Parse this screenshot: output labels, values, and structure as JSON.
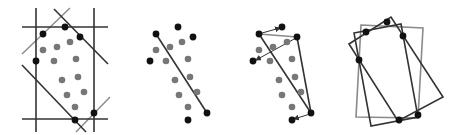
{
  "figure": {
    "colors": {
      "hull_point": "#111111",
      "interior_point": "#777777",
      "line_dark": "#333333",
      "line_gray": "#8a8a8a",
      "background": "#ffffff"
    },
    "panels": [
      {
        "id": "panel-1",
        "caption": "",
        "hull_points": [
          [
            43,
            34
          ],
          [
            65,
            27
          ],
          [
            80,
            37
          ],
          [
            36,
            61
          ],
          [
            94,
            113
          ],
          [
            75,
            120
          ]
        ],
        "interior_points": [
          [
            43,
            50
          ],
          [
            57,
            47
          ],
          [
            70,
            42
          ],
          [
            54,
            61
          ],
          [
            76,
            59
          ],
          [
            62,
            80
          ],
          [
            78,
            77
          ],
          [
            67,
            95
          ],
          [
            84,
            92
          ],
          [
            75,
            107
          ]
        ],
        "dark_lines": [
          [
            36,
            8,
            36,
            132
          ],
          [
            94,
            8,
            94,
            132
          ],
          [
            22,
            27,
            108,
            27
          ],
          [
            22,
            119,
            108,
            119
          ],
          [
            54,
            9,
            108,
            64
          ],
          [
            22,
            65,
            86,
            132
          ]
        ],
        "gray_lines": [
          [
            22,
            54,
            70,
            8
          ],
          [
            76,
            132,
            110,
            97
          ]
        ]
      },
      {
        "id": "panel-2",
        "caption": "",
        "hull_points": [
          [
            156,
            34
          ],
          [
            178,
            27
          ],
          [
            193,
            37
          ],
          [
            150,
            61
          ],
          [
            207,
            113
          ],
          [
            188,
            120
          ]
        ],
        "interior_points": [
          [
            156,
            50
          ],
          [
            170,
            47
          ],
          [
            182,
            42
          ],
          [
            166,
            61
          ],
          [
            188,
            59
          ],
          [
            175,
            80
          ],
          [
            190,
            77
          ],
          [
            179,
            95
          ],
          [
            197,
            92
          ],
          [
            188,
            107
          ]
        ],
        "dark_lines": [
          [
            156,
            34,
            207,
            113
          ]
        ],
        "gray_lines": []
      },
      {
        "id": "panel-3",
        "caption": "",
        "hull_points": [
          [
            259,
            34
          ],
          [
            282,
            27
          ],
          [
            297,
            37
          ],
          [
            253,
            61
          ],
          [
            311,
            113
          ],
          [
            292,
            120
          ]
        ],
        "interior_points": [
          [
            259,
            50
          ],
          [
            273,
            47
          ],
          [
            287,
            42
          ],
          [
            270,
            61
          ],
          [
            292,
            59
          ],
          [
            279,
            80
          ],
          [
            295,
            77
          ],
          [
            282,
            95
          ],
          [
            301,
            92
          ],
          [
            292,
            107
          ]
        ],
        "dark_lines": [
          [
            259,
            34,
            311,
            113
          ],
          [
            297,
            37,
            311,
            113
          ]
        ],
        "gray_lines": [
          [
            259,
            34,
            297,
            37
          ]
        ],
        "arrows": [
          [
            262,
            33,
            280,
            28
          ],
          [
            296,
            38,
            256,
            60
          ],
          [
            310,
            114,
            294,
            119
          ]
        ]
      },
      {
        "id": "panel-4",
        "caption": "",
        "hull_points": [
          [
            387,
            22
          ],
          [
            366,
            32
          ],
          [
            403,
            36
          ],
          [
            359,
            60
          ],
          [
            418,
            115
          ],
          [
            399,
            120
          ]
        ],
        "gray_rects": [
          [
            [
              361,
              25
            ],
            [
              423,
              28
            ],
            [
              418,
              118
            ],
            [
              356,
              117
            ]
          ]
        ],
        "dark_rects": [
          [
            [
              354,
              33
            ],
            [
              401,
              24
            ],
            [
              418,
              117
            ],
            [
              371,
              126
            ]
          ],
          [
            [
              349,
              44
            ],
            [
              391,
              17
            ],
            [
              443,
              97
            ],
            [
              398,
              121
            ]
          ]
        ]
      }
    ]
  }
}
